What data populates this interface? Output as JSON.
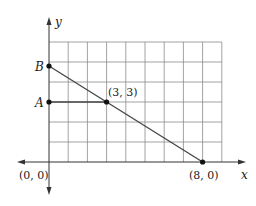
{
  "diagram": {
    "type": "coordinate-grid-line",
    "axes": {
      "x_label": "x",
      "y_label": "y",
      "origin_label": "(0, 0)"
    },
    "grid": {
      "cols": 9,
      "rows": 6,
      "x_min": 0,
      "x_max": 9,
      "y_min": 0,
      "y_max": 6
    },
    "points": [
      {
        "id": "B",
        "label": "B",
        "x": 0,
        "y": 4.8
      },
      {
        "id": "A",
        "label": "A",
        "x": 0,
        "y": 3
      },
      {
        "id": "P33",
        "label": "(3, 3)",
        "x": 3,
        "y": 3
      },
      {
        "id": "P80",
        "label": "(8, 0)",
        "x": 8,
        "y": 0
      }
    ],
    "segments": [
      {
        "from": "B",
        "to": "P80",
        "description": "line through (3, 3) and (8, 0)"
      },
      {
        "from": "A",
        "to": "P33",
        "description": "horizontal segment from A to (3, 3)"
      }
    ],
    "colors": {
      "grid": "#888888",
      "axis": "#333333",
      "line": "#444444",
      "point": "#111111"
    }
  }
}
